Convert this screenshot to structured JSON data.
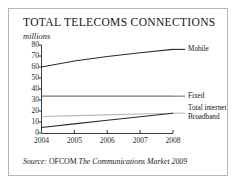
{
  "figure": {
    "title": "TOTAL TELECOMS CONNECTIONS",
    "subtitle": "millions",
    "source": {
      "word": "Source:",
      "org": "OFCOM",
      "publication": "The Communications Market 2009"
    },
    "border_color": "#b8b6b2"
  },
  "labels": {
    "mobile": "Mobile",
    "fixed": "Fixed",
    "total_internet": "Total internet",
    "broadband": "Broadband"
  },
  "axis": {
    "y_ticks": [
      "80",
      "70",
      "60",
      "50",
      "40",
      "30",
      "20",
      "10",
      "0"
    ],
    "x_ticks": [
      "2004",
      "2005",
      "2006",
      "2007",
      "2008"
    ]
  },
  "chart_data": {
    "type": "line",
    "title": "TOTAL TELECOMS CONNECTIONS",
    "subtitle": "millions",
    "xlabel": "",
    "ylabel": "millions",
    "x": [
      2004,
      2005,
      2006,
      2007,
      2008
    ],
    "xlim": [
      2004,
      2008
    ],
    "ylim": [
      0,
      80
    ],
    "y_ticks": [
      0,
      10,
      20,
      30,
      40,
      50,
      60,
      70,
      80
    ],
    "grid": false,
    "legend": "right-inline-labels",
    "series": [
      {
        "name": "Mobile",
        "values": [
          60,
          65.5,
          69.5,
          73,
          76
        ],
        "color": "#2b2b2b"
      },
      {
        "name": "Fixed",
        "values": [
          33.5,
          33.5,
          33.5,
          33.5,
          33.5
        ],
        "color": "#767676"
      },
      {
        "name": "Total internet",
        "values": [
          15,
          15.8,
          16.5,
          17.3,
          18
        ],
        "color": "#b9b9b9"
      },
      {
        "name": "Broadband",
        "values": [
          5,
          8.3,
          11.6,
          14.8,
          18
        ],
        "color": "#2b2b2b"
      }
    ],
    "source": "Source: OFCOM The Communications Market 2009"
  }
}
